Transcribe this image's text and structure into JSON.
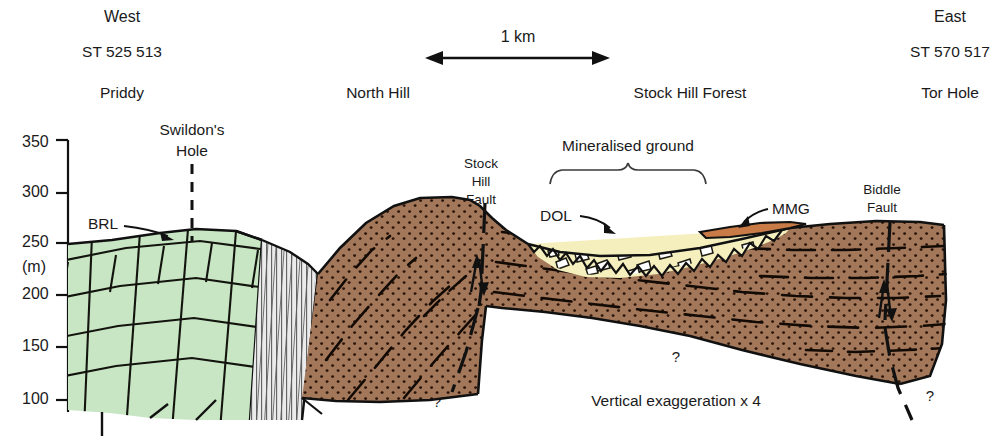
{
  "figure": {
    "type": "geological-cross-section",
    "title_orientation_left": "West",
    "title_orientation_right": "East",
    "grid_ref_left": "ST 525 513",
    "grid_ref_right": "ST 570 517",
    "note": "Vertical exaggeration x 4"
  },
  "scalebar": {
    "label": "1 km",
    "x_start_px": 425,
    "x_end_px": 610,
    "y_px": 58
  },
  "places": [
    {
      "name": "Priddy",
      "x_px": 122,
      "y_px": 92
    },
    {
      "name": "North  Hill",
      "x_px": 378,
      "y_px": 92
    },
    {
      "name": "Stock Hill Forest",
      "x_px": 690,
      "y_px": 92
    },
    {
      "name": "Tor Hole",
      "x_px": 950,
      "y_px": 92
    }
  ],
  "axis": {
    "unit_label": "(m)",
    "ticks": [
      {
        "value": "350",
        "y_px": 143
      },
      {
        "value": "300",
        "y_px": 193
      },
      {
        "value": "250",
        "y_px": 243
      },
      {
        "value": "200",
        "y_px": 295
      },
      {
        "value": "150",
        "y_px": 347
      },
      {
        "value": "100",
        "y_px": 400
      }
    ],
    "unit_y_px": 268,
    "axis_x_px": 68
  },
  "annotations": {
    "swildons_hole_line1": "Swildon's",
    "swildons_hole_line2": "Hole",
    "brl": "BRL",
    "avon_group_line1": "AVON",
    "avon_group_line2": "GROUP",
    "portishead_line1": "PORTISHEAD",
    "portishead_line2": "FORMATION",
    "stock_hill_fault_line1": "Stock",
    "stock_hill_fault_line2": "Hill",
    "stock_hill_fault_line3": "Fault",
    "mineralised_ground": "Mineralised ground",
    "dol": "DOL",
    "mmg": "MMG",
    "biddle_fault_line1": "Biddle",
    "biddle_fault_line2": "Fault",
    "query_centre": "?",
    "query_left": "?",
    "query_right": "?"
  },
  "units": [
    {
      "code": "BRL",
      "name": "Black Rock Limestone",
      "color": "#c8e6c4",
      "pattern": "brick-blocks"
    },
    {
      "code": "AVON GROUP",
      "name": "Avon Group",
      "color": "#e3e3e3",
      "pattern": "vertical-lines"
    },
    {
      "code": "PORTISHEAD FORMATION",
      "name": "Portishead Formation",
      "color": "#a3775a",
      "pattern": "stipple-dots"
    },
    {
      "code": "DOL",
      "name": "Dolomitic Conglomerate",
      "color": "#f5efbe",
      "pattern": "breccia-clasts"
    },
    {
      "code": "MMG",
      "name": "Mercia Mudstone Group",
      "color": "#c87b46",
      "pattern": "solid"
    }
  ],
  "colors": {
    "brl_green": "#c8e6c4",
    "avon_grey": "#e6e6e6",
    "portishead_brown": "#a3775a",
    "dol_cream": "#f5efbe",
    "mmg_orange": "#c87b46",
    "ink": "#1a1a1a",
    "background": "#ffffff"
  }
}
